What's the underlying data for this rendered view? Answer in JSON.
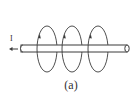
{
  "figure": {
    "caption": "(a)",
    "current_label": "I",
    "colors": {
      "stroke": "#3a3a3a",
      "background": "#ffffff"
    },
    "rod": {
      "x1": 21,
      "x2": 127,
      "y_top": 45,
      "y_bottom": 52
    },
    "loops": [
      {
        "cx": 47,
        "cy": 49,
        "rx": 10,
        "ry": 23
      },
      {
        "cx": 72,
        "cy": 49,
        "rx": 10,
        "ry": 23
      },
      {
        "cx": 98,
        "cy": 49,
        "rx": 10,
        "ry": 23
      }
    ]
  }
}
